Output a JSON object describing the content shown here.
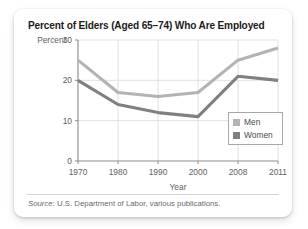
{
  "card": {
    "title": "Percent of Elders (Aged 65–74) Who Are Employed",
    "source_prefix": "Source:",
    "source_text": " U.S. Department of Labor, various publications."
  },
  "legend": {
    "men_label": "Men",
    "women_label": "Women"
  },
  "colors": {
    "men": "#b3b3b3",
    "women": "#808080",
    "grid": "#d9d9d9",
    "axis": "#8d8d8d",
    "text": "#5e5e5e",
    "title": "#1b1b1b",
    "card_background": "#ffffff"
  },
  "chart_data": {
    "type": "line",
    "title": "Percent of Elders (Aged 65–74) Who Are Employed",
    "xlabel": "Year",
    "ylabel": "Percent",
    "categories": [
      "1970",
      "1980",
      "1990",
      "2000",
      "2008",
      "2011"
    ],
    "x": [
      1970,
      1980,
      1990,
      2000,
      2008,
      2011
    ],
    "series": [
      {
        "name": "Men",
        "values": [
          25,
          17,
          16,
          17,
          25,
          28
        ],
        "color": "#b3b3b3"
      },
      {
        "name": "Women",
        "values": [
          20,
          14,
          12,
          11,
          21,
          20
        ],
        "color": "#808080"
      }
    ],
    "ylim": [
      0,
      30
    ],
    "yticks": [
      0,
      10,
      20,
      30
    ],
    "ytick_labels": [
      "0",
      "10",
      "20",
      "30"
    ],
    "xtick_labels": [
      "1970",
      "1980",
      "1990",
      "2000",
      "2008",
      "2011"
    ],
    "grid": true,
    "legend_position": "inside-right"
  }
}
